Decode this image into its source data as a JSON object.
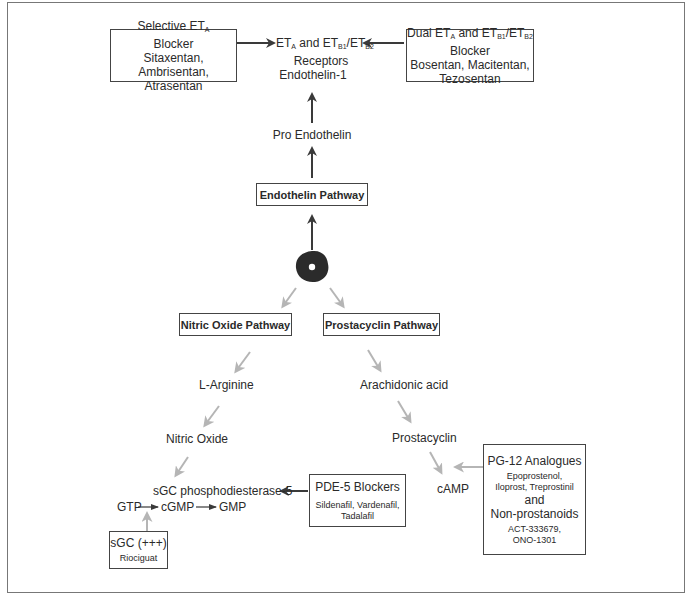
{
  "diagram": {
    "top": {
      "selective_blocker": {
        "title_prefix": "Selective ET",
        "title_sub": "A",
        "line2": "Blocker",
        "line3": "Sitaxentan, Ambrisentan,",
        "line4": "Atrasentan"
      },
      "receptors": {
        "p1": "ET",
        "s1": "A",
        "p2": " and ET",
        "s2": "B1",
        "p3": "/ET",
        "s3": "B2",
        "line2": "Receptors"
      },
      "dual_blocker": {
        "p1": "Dual ET",
        "s1": "A",
        "p2": " and ET",
        "s2": "B1",
        "p3": "/ET",
        "s3": "B2",
        "line2": "Blocker",
        "line3": "Bosentan, Macitentan,",
        "line4": "Tezosentan"
      },
      "endothelin1": "Endothelin-1",
      "pro_endothelin": "Pro Endothelin",
      "endothelin_pathway": "Endothelin Pathway"
    },
    "center_icon": "cell-icon",
    "nitric_oxide": {
      "pathway": "Nitric Oxide Pathway",
      "l_arginine": "L-Arginine",
      "nitric_oxide": "Nitric Oxide",
      "sgc_pde5": "sGC phosphodiesterase-5",
      "gtp": "GTP",
      "cgmp": "cGMP",
      "gmp": "GMP",
      "sgc_box": {
        "title": "sGC (+++)",
        "drug": "Riociguat"
      }
    },
    "pde5": {
      "title": "PDE-5 Blockers",
      "line2": "Sildenafil, Vardenafil,",
      "line3": "Tadalafil"
    },
    "prostacyclin": {
      "pathway": "Prostacyclin Pathway",
      "arachidonic": "Arachidonic acid",
      "prostacyclin": "Prostacyclin",
      "camp": "cAMP"
    },
    "pg12": {
      "title": "PG-12 Analogues",
      "line2": "Epoprostenol,",
      "line3": "Iloprost, Treprostinil",
      "and": "and",
      "title2": "Non-prostanoids",
      "line5": "ACT-333679,",
      "line6": "ONO-1301"
    },
    "colors": {
      "dark_arrow": "#3a3a3a",
      "light_arrow": "#b5b5b5",
      "border": "#444444"
    }
  }
}
